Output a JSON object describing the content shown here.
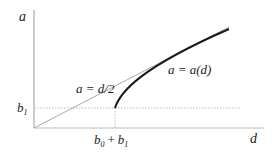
{
  "diagram": {
    "axis_y_label": "a",
    "axis_x_label": "d",
    "line_label": "a = d/2",
    "curve_label": "a = a(d)",
    "ytick_label": {
      "base": "b",
      "sub": "1"
    },
    "xtick_label": {
      "b0": "b",
      "b0_sub": "0",
      "plus": "+",
      "b1": "b",
      "b1_sub": "1"
    }
  }
}
